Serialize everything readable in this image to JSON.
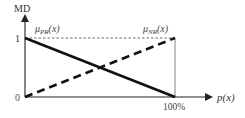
{
  "diagram": {
    "y_axis_label": "MD",
    "x_axis_label": "p(x)",
    "y_ticks": {
      "top": "1",
      "bottom": "0"
    },
    "x_ticks": {
      "right": "100%"
    },
    "curves": [
      {
        "name": "mu_PR",
        "label_main": "μ",
        "label_sub": "PR",
        "label_arg": "(x)",
        "style": "solid",
        "from": [
          0,
          1
        ],
        "to": [
          100,
          0
        ]
      },
      {
        "name": "mu_NR",
        "label_main": "μ",
        "label_sub": "NR",
        "label_arg": "(x)",
        "style": "dashed",
        "from": [
          0,
          0
        ],
        "to": [
          100,
          1
        ]
      }
    ],
    "colors": {
      "line": "#111111",
      "axis": "#222222",
      "guide": "#555555",
      "text": "#333333"
    }
  }
}
